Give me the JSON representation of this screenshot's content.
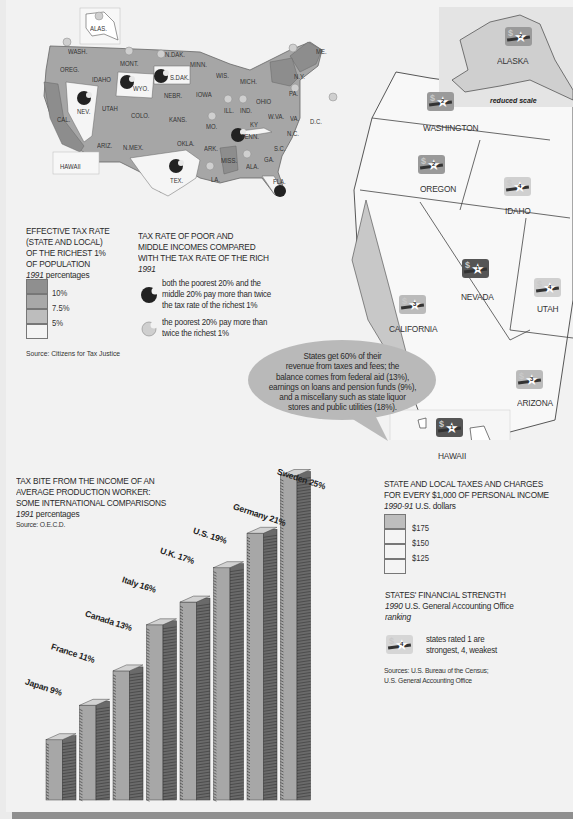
{
  "map_left": {
    "states": [
      {
        "label": "ALAS.",
        "x": 90,
        "y": 25
      },
      {
        "label": "WASH.",
        "x": 68,
        "y": 48
      },
      {
        "label": "OREG.",
        "x": 60,
        "y": 66
      },
      {
        "label": "IDAHO",
        "x": 92,
        "y": 76
      },
      {
        "label": "MONT.",
        "x": 120,
        "y": 60
      },
      {
        "label": "N.DAK.",
        "x": 165,
        "y": 51
      },
      {
        "label": "S.DAK.",
        "x": 170,
        "y": 74
      },
      {
        "label": "WYO.",
        "x": 133,
        "y": 85
      },
      {
        "label": "MINN.",
        "x": 190,
        "y": 61
      },
      {
        "label": "WIS.",
        "x": 216,
        "y": 72
      },
      {
        "label": "MICH.",
        "x": 240,
        "y": 78
      },
      {
        "label": "N.Y.",
        "x": 294,
        "y": 73
      },
      {
        "label": "ME.",
        "x": 316,
        "y": 48
      },
      {
        "label": "NEV.",
        "x": 77,
        "y": 108
      },
      {
        "label": "UTAH",
        "x": 102,
        "y": 105
      },
      {
        "label": "COLO.",
        "x": 131,
        "y": 112
      },
      {
        "label": "NEBR.",
        "x": 164,
        "y": 92
      },
      {
        "label": "IOWA",
        "x": 196,
        "y": 91
      },
      {
        "label": "ILL.",
        "x": 224,
        "y": 107
      },
      {
        "label": "IND.",
        "x": 240,
        "y": 107
      },
      {
        "label": "OHIO",
        "x": 256,
        "y": 98
      },
      {
        "label": "PA.",
        "x": 289,
        "y": 90
      },
      {
        "label": "W.VA.",
        "x": 268,
        "y": 113
      },
      {
        "label": "VA.",
        "x": 290,
        "y": 115
      },
      {
        "label": "KY",
        "x": 250,
        "y": 121
      },
      {
        "label": "MO.",
        "x": 206,
        "y": 123
      },
      {
        "label": "KANS.",
        "x": 169,
        "y": 116
      },
      {
        "label": "CAL.",
        "x": 57,
        "y": 116
      },
      {
        "label": "ARIZ.",
        "x": 97,
        "y": 142
      },
      {
        "label": "N.MEX.",
        "x": 123,
        "y": 144
      },
      {
        "label": "OKLA.",
        "x": 177,
        "y": 140
      },
      {
        "label": "ARK.",
        "x": 204,
        "y": 145
      },
      {
        "label": "TENN.",
        "x": 241,
        "y": 133
      },
      {
        "label": "N.C.",
        "x": 287,
        "y": 130
      },
      {
        "label": "S.C.",
        "x": 274,
        "y": 145
      },
      {
        "label": "GA.",
        "x": 264,
        "y": 156
      },
      {
        "label": "ALA.",
        "x": 246,
        "y": 163
      },
      {
        "label": "MISS.",
        "x": 221,
        "y": 157
      },
      {
        "label": "LA.",
        "x": 211,
        "y": 176
      },
      {
        "label": "TEX.",
        "x": 170,
        "y": 177
      },
      {
        "label": "FLA.",
        "x": 273,
        "y": 178
      },
      {
        "label": "D.C.",
        "x": 310,
        "y": 118
      },
      {
        "label": "HAWAII",
        "x": 60,
        "y": 163
      }
    ]
  },
  "legend_rich_tax": {
    "title_lines": [
      "EFFECTIVE TAX RATE",
      "(STATE AND LOCAL)",
      "OF THE RICHEST 1%",
      "OF POPULATION"
    ],
    "year": "1991",
    "unit": "percentages",
    "levels": [
      {
        "label": "10%",
        "color": "#8f8f8f"
      },
      {
        "label": "7.5%",
        "color": "#a8a8a8"
      },
      {
        "label": "5%",
        "color": "#bdbdbd"
      },
      {
        "label": "",
        "color": "#f4f4f4"
      }
    ],
    "source": "Source: Citizens for Tax Justice"
  },
  "legend_poor_vs_rich": {
    "title_lines": [
      "TAX RATE OF POOR AND",
      "MIDDLE INCOMES COMPARED",
      "WITH THE TAX RATE OF THE RICH"
    ],
    "year": "1991",
    "items": [
      {
        "icon": "dark-bitten-circle-icon",
        "lines": [
          "both the poorest 20% and the",
          "middle 20% pay more than twice",
          "the tax rate of the richest 1%"
        ]
      },
      {
        "icon": "light-bitten-circle-icon",
        "lines": [
          "the poorest 20% pay more than",
          "twice the richest 1%"
        ]
      }
    ]
  },
  "bubble": {
    "lines": [
      "States get 60% of their",
      "revenue from taxes and fees; the",
      "balance comes from federal aid (13%),",
      "earnings on loans and pension funds (9%),",
      "and a miscellany such as state liquor",
      "stores and public utilities (18%)."
    ]
  },
  "map_right": {
    "alaska_note": "reduced scale",
    "states": [
      {
        "name": "ALASKA",
        "rank": "2",
        "shade": "#9a9a9a"
      },
      {
        "name": "WASHINGTON",
        "rank": "2",
        "shade": "#9a9a9a"
      },
      {
        "name": "OREGON",
        "rank": "2",
        "shade": "#9a9a9a"
      },
      {
        "name": "IDAHO",
        "rank": "4",
        "shade": "#d0d0d0"
      },
      {
        "name": "NEVADA",
        "rank": "1",
        "shade": "#555555"
      },
      {
        "name": "UTAH",
        "rank": "4",
        "shade": "#d0d0d0"
      },
      {
        "name": "CALIFORNIA",
        "rank": "3",
        "shade": "#bbbbbb"
      },
      {
        "name": "ARIZONA",
        "rank": "3",
        "shade": "#bbbbbb"
      },
      {
        "name": "HAWAII",
        "rank": "1",
        "shade": "#555555"
      }
    ]
  },
  "legend_state_local": {
    "title_lines": [
      "STATE AND LOCAL TAXES AND CHARGES",
      "FOR EVERY $1,000 OF PERSONAL INCOME"
    ],
    "year": "1990-91",
    "unit": "U.S. dollars",
    "levels": [
      {
        "label": "$175",
        "color": "#bdbdbd"
      },
      {
        "label": "$150",
        "color": "#f4f4f4"
      },
      {
        "label": "$125",
        "color": "#f4f4f4"
      },
      {
        "label": "",
        "color": "#f4f4f4"
      }
    ]
  },
  "legend_financial_strength": {
    "title": "STATES' FINANCIAL STRENGTH",
    "year": "1990",
    "source_inline": "U.S. General Accounting Office",
    "unit": "ranking",
    "item_lines": [
      "states rated 1 are",
      "strongest, 4, weakest"
    ],
    "sources_lines": [
      "Sources: U.S. Bureau of the Census;",
      "U.S. General Accounting Office"
    ]
  },
  "chart_data": {
    "type": "bar",
    "title": "TAX BITE FROM THE INCOME OF AN AVERAGE PRODUCTION WORKER: SOME INTERNATIONAL COMPARISONS",
    "title_lines": [
      "TAX BITE FROM THE INCOME OF AN",
      "AVERAGE PRODUCTION WORKER:",
      "SOME INTERNATIONAL COMPARISONS"
    ],
    "subtitle_year": "1991",
    "subtitle_unit": "percentages",
    "source": "Source: O.E.C.D.",
    "categories": [
      "Japan",
      "France",
      "Canada",
      "Italy",
      "U.K.",
      "U.S.",
      "Germany",
      "Sweden"
    ],
    "values": [
      9,
      11,
      13,
      16,
      17,
      19,
      21,
      25
    ],
    "labels": [
      "Japan 9%",
      "France 11%",
      "Canada 13%",
      "Italy 16%",
      "U.K. 17%",
      "U.S. 19%",
      "Germany 21%",
      "Sweden 25%"
    ],
    "xlabel": "",
    "ylabel": "",
    "ylim": [
      0,
      25
    ],
    "grid": false,
    "legend": "none"
  }
}
